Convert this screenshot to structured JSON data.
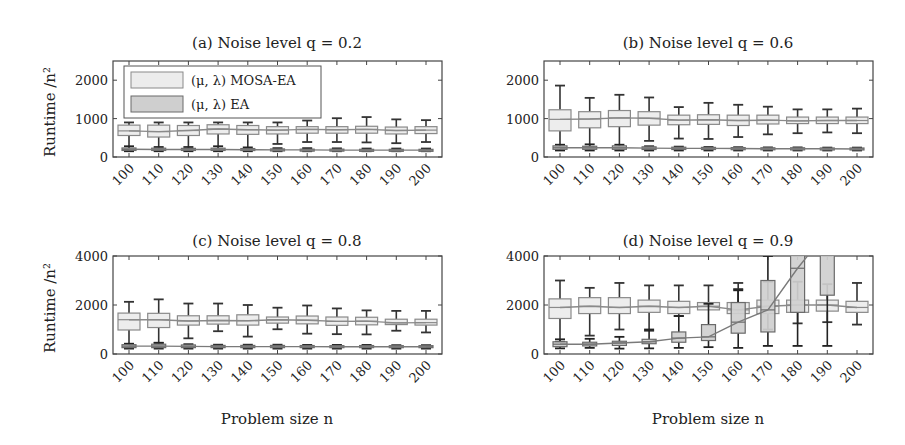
{
  "figure": {
    "xlabel": "Problem size n",
    "ylabel": "Runtime /n²",
    "legend": {
      "entries": [
        {
          "label": "(μ, λ) MOSA-EA",
          "fill": "#ececec",
          "stroke": "#8a8a8a"
        },
        {
          "label": "(μ, λ) EA",
          "fill": "#cfcfcf",
          "stroke": "#6a6a6a"
        }
      ]
    }
  },
  "chart_data": [
    {
      "type": "box",
      "title": "(a) Noise level q = 0.2",
      "xlabel": "",
      "ylabel": "Runtime /n²",
      "categories": [
        "100",
        "110",
        "120",
        "130",
        "140",
        "150",
        "160",
        "170",
        "180",
        "190",
        "200"
      ],
      "ylim": [
        0,
        2500
      ],
      "yticks": [
        0,
        1000,
        2000
      ],
      "series": [
        {
          "name": "(μ, λ) MOSA-EA",
          "median": [
            680,
            660,
            690,
            730,
            710,
            700,
            720,
            710,
            720,
            690,
            700
          ],
          "q1": [
            560,
            520,
            560,
            600,
            590,
            600,
            620,
            620,
            620,
            600,
            610
          ],
          "q3": [
            830,
            830,
            820,
            840,
            820,
            790,
            790,
            790,
            800,
            780,
            790
          ],
          "whisker_low": [
            200,
            200,
            200,
            200,
            200,
            340,
            390,
            390,
            380,
            360,
            390
          ],
          "whisker_high": [
            900,
            900,
            900,
            900,
            900,
            900,
            950,
            1010,
            1040,
            980,
            960
          ]
        },
        {
          "name": "(μ, λ) EA",
          "median": [
            200,
            195,
            195,
            195,
            190,
            185,
            185,
            180,
            180,
            180,
            180
          ],
          "q1": [
            170,
            170,
            170,
            170,
            170,
            165,
            165,
            160,
            160,
            160,
            160
          ],
          "q3": [
            235,
            230,
            225,
            230,
            220,
            210,
            205,
            205,
            200,
            200,
            200
          ],
          "whisker_low": [
            150,
            150,
            150,
            150,
            150,
            150,
            150,
            150,
            150,
            150,
            150
          ],
          "whisker_high": [
            280,
            260,
            260,
            280,
            250,
            230,
            230,
            225,
            220,
            220,
            220
          ]
        }
      ]
    },
    {
      "type": "box",
      "title": "(b) Noise level q = 0.6",
      "xlabel": "",
      "ylabel": "",
      "categories": [
        "100",
        "110",
        "120",
        "130",
        "140",
        "150",
        "160",
        "170",
        "180",
        "190",
        "200"
      ],
      "ylim": [
        0,
        2500
      ],
      "yticks": [
        0,
        1000,
        2000
      ],
      "series": [
        {
          "name": "(μ, λ) MOSA-EA",
          "median": [
            980,
            990,
            1020,
            1010,
            960,
            970,
            950,
            960,
            940,
            950,
            950
          ],
          "q1": [
            680,
            760,
            790,
            830,
            840,
            850,
            820,
            860,
            870,
            870,
            870
          ],
          "q3": [
            1230,
            1180,
            1210,
            1180,
            1090,
            1100,
            1090,
            1090,
            1040,
            1040,
            1040
          ],
          "whisker_low": [
            250,
            250,
            250,
            420,
            480,
            470,
            520,
            590,
            620,
            640,
            620
          ],
          "whisker_high": [
            1860,
            1540,
            1620,
            1550,
            1300,
            1410,
            1360,
            1310,
            1240,
            1240,
            1260
          ]
        },
        {
          "name": "(μ, λ) EA",
          "median": [
            240,
            240,
            240,
            230,
            225,
            225,
            220,
            215,
            215,
            215,
            210
          ],
          "q1": [
            200,
            200,
            200,
            195,
            195,
            195,
            190,
            190,
            185,
            185,
            185
          ],
          "q3": [
            290,
            280,
            290,
            265,
            255,
            250,
            245,
            240,
            240,
            235,
            235
          ],
          "whisker_low": [
            170,
            170,
            170,
            170,
            170,
            170,
            170,
            170,
            170,
            170,
            170
          ],
          "whisker_high": [
            320,
            330,
            320,
            280,
            270,
            260,
            255,
            250,
            250,
            245,
            245
          ]
        }
      ]
    },
    {
      "type": "box",
      "title": "(c) Noise level q = 0.8",
      "xlabel": "Problem size n",
      "ylabel": "Runtime /n²",
      "categories": [
        "100",
        "110",
        "120",
        "130",
        "140",
        "150",
        "160",
        "170",
        "180",
        "190",
        "200"
      ],
      "ylim": [
        0,
        4000
      ],
      "yticks": [
        0,
        2000,
        4000
      ],
      "series": [
        {
          "name": "(μ, λ) MOSA-EA",
          "median": [
            1400,
            1400,
            1350,
            1370,
            1360,
            1400,
            1380,
            1330,
            1340,
            1270,
            1280
          ],
          "q1": [
            980,
            1080,
            1180,
            1220,
            1180,
            1260,
            1230,
            1170,
            1190,
            1200,
            1180
          ],
          "q3": [
            1670,
            1660,
            1560,
            1560,
            1600,
            1510,
            1550,
            1510,
            1500,
            1420,
            1420
          ],
          "whisker_low": [
            300,
            450,
            640,
            930,
            710,
            1010,
            830,
            810,
            800,
            950,
            880
          ],
          "whisker_high": [
            2130,
            2230,
            2060,
            2060,
            2000,
            1890,
            1980,
            1860,
            1780,
            1760,
            1760
          ]
        },
        {
          "name": "(μ, λ) EA",
          "median": [
            320,
            320,
            310,
            300,
            300,
            300,
            300,
            295,
            295,
            295,
            295
          ],
          "q1": [
            260,
            260,
            260,
            260,
            260,
            260,
            260,
            260,
            260,
            260,
            260
          ],
          "q3": [
            380,
            400,
            370,
            350,
            350,
            350,
            345,
            340,
            345,
            340,
            340
          ],
          "whisker_low": [
            220,
            220,
            220,
            220,
            220,
            220,
            220,
            220,
            220,
            220,
            220
          ],
          "whisker_high": [
            420,
            460,
            400,
            380,
            380,
            380,
            370,
            370,
            370,
            360,
            360
          ]
        }
      ]
    },
    {
      "type": "box",
      "title": "(d) Noise level q = 0.9",
      "xlabel": "Problem size n",
      "ylabel": "",
      "categories": [
        "100",
        "110",
        "120",
        "130",
        "140",
        "150",
        "160",
        "170",
        "180",
        "190",
        "200"
      ],
      "ylim": [
        0,
        4000
      ],
      "yticks": [
        0,
        2000,
        4000
      ],
      "series": [
        {
          "name": "(μ, λ) MOSA-EA",
          "median": [
            1900,
            1950,
            1900,
            1950,
            1900,
            1950,
            1800,
            1950,
            2000,
            2000,
            1900
          ],
          "q1": [
            1450,
            1650,
            1650,
            1700,
            1650,
            1800,
            1650,
            1650,
            1700,
            1750,
            1700
          ],
          "q3": [
            2250,
            2300,
            2300,
            2200,
            2150,
            2100,
            2100,
            2200,
            2200,
            2200,
            2150
          ],
          "whisker_low": [
            500,
            750,
            1000,
            950,
            1550,
            2050,
            2650,
            1000,
            1250,
            1300,
            1200
          ],
          "whisker_high": [
            3000,
            2700,
            2900,
            2800,
            2800,
            2800,
            2900,
            2950,
            2950,
            2850,
            2900
          ]
        },
        {
          "name": "(μ, λ) EA",
          "median": [
            400,
            400,
            450,
            500,
            650,
            700,
            1300,
            1800,
            3500,
            5000,
            null
          ],
          "q1": [
            300,
            330,
            350,
            420,
            480,
            550,
            850,
            900,
            1700,
            2400,
            null
          ],
          "q3": [
            500,
            480,
            520,
            600,
            900,
            1200,
            2100,
            3000,
            5000,
            6000,
            null
          ],
          "whisker_low": [
            230,
            250,
            220,
            230,
            250,
            280,
            250,
            330,
            330,
            330,
            null
          ],
          "whisker_high": [
            600,
            620,
            700,
            1000,
            1550,
            2050,
            2600,
            4000,
            4000,
            4000,
            null
          ]
        }
      ]
    }
  ]
}
